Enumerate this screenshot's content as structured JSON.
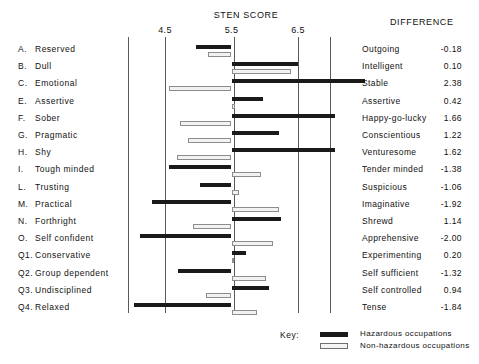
{
  "header": {
    "sten_title": "STEN SCORE",
    "difference_title": "DIFFERENCE"
  },
  "axis": {
    "ticks": [
      {
        "label": "4.5",
        "value": 4.5
      },
      {
        "label": "5.5",
        "value": 5.5
      },
      {
        "label": "6.5",
        "value": 6.5
      }
    ]
  },
  "key": {
    "title": "Key:",
    "hazardous_label": "Hazardous occupations",
    "nonhazardous_label": "Non-hazardous occupations"
  },
  "colors": {
    "hazardous": "#1a1a1a",
    "nonhazardous": "#f2f2f2",
    "nonhazardous_border": "#8d8d8d",
    "gridline": "#5a5a5a",
    "text": "#111111",
    "background": "#ffffff"
  },
  "chart_data": {
    "type": "bar",
    "title": "STEN SCORE",
    "xlabel": "STEN SCORE",
    "ylabel": "",
    "xlim": [
      4.0,
      7.5
    ],
    "grid": true,
    "orientation": "horizontal",
    "baseline": 5.5,
    "legend": [
      "Hazardous occupations",
      "Non-hazardous occupations"
    ],
    "legend_position": "bottom",
    "xticks": [
      4.5,
      5.5,
      6.5
    ],
    "categories": [
      "A. Reserved",
      "B. Dull",
      "C. Emotional",
      "E. Assertive",
      "F. Sober",
      "G. Pragmatic",
      "H. Shy",
      "I. Tough minded",
      "L. Trusting",
      "M. Practical",
      "N. Forthright",
      "O. Self confident",
      "Q1. Conservative",
      "Q2. Group dependent",
      "Q3. Undisciplined",
      "Q4. Relaxed"
    ],
    "right_poles": [
      "Outgoing",
      "Intelligent",
      "Stable",
      "Assertive",
      "Happy-go-lucky",
      "Conscientious",
      "Venturesome",
      "Tender minded",
      "Suspicious",
      "Imaginative",
      "Shrewd",
      "Apprehensive",
      "Experimenting",
      "Self sufficient",
      "Self controlled",
      "Tense"
    ],
    "differences": [
      -0.18,
      0.1,
      2.38,
      0.42,
      1.66,
      1.22,
      1.62,
      -1.38,
      -1.06,
      -1.92,
      1.14,
      -2.0,
      0.2,
      -1.32,
      0.94,
      -1.84
    ],
    "series": [
      {
        "name": "Hazardous occupations",
        "values": [
          4.96,
          6.5,
          7.5,
          5.98,
          7.06,
          6.22,
          7.06,
          4.56,
          5.02,
          4.3,
          6.24,
          4.12,
          5.72,
          4.7,
          6.06,
          4.04
        ]
      },
      {
        "name": "Non-hazardous occupations",
        "values": [
          5.14,
          6.4,
          4.56,
          5.56,
          4.72,
          4.84,
          4.68,
          5.94,
          5.62,
          6.22,
          4.92,
          6.12,
          5.52,
          6.02,
          5.12,
          5.88
        ]
      }
    ]
  },
  "rows": [
    {
      "key": "A.",
      "left": "Reserved",
      "right": "Outgoing",
      "diff": "-0.18",
      "haz": {
        "start": 4.96,
        "end": 5.5
      },
      "non": {
        "start": 5.5,
        "end": 5.14
      }
    },
    {
      "key": "B.",
      "left": "Dull",
      "right": "Intelligent",
      "diff": "0.10",
      "haz": {
        "start": 5.5,
        "end": 6.5
      },
      "non": {
        "start": 5.5,
        "end": 6.4
      }
    },
    {
      "key": "C.",
      "left": "Emotional",
      "right": "Stable",
      "diff": "2.38",
      "haz": {
        "start": 5.5,
        "end": 7.5
      },
      "non": {
        "start": 4.56,
        "end": 5.5
      }
    },
    {
      "key": "E.",
      "left": "Assertive",
      "right": "Assertive",
      "diff": "0.42",
      "haz": {
        "start": 5.5,
        "end": 5.98
      },
      "non": {
        "start": 5.5,
        "end": 5.56
      }
    },
    {
      "key": "F.",
      "left": "Sober",
      "right": "Happy-go-lucky",
      "diff": "1.66",
      "haz": {
        "start": 5.5,
        "end": 7.06
      },
      "non": {
        "start": 4.72,
        "end": 5.5
      }
    },
    {
      "key": "G.",
      "left": "Pragmatic",
      "right": "Conscientious",
      "diff": "1.22",
      "haz": {
        "start": 5.5,
        "end": 6.22
      },
      "non": {
        "start": 4.84,
        "end": 5.5
      }
    },
    {
      "key": "H.",
      "left": "Shy",
      "right": "Venturesome",
      "diff": "1.62",
      "haz": {
        "start": 5.5,
        "end": 7.06
      },
      "non": {
        "start": 4.68,
        "end": 5.5
      }
    },
    {
      "key": "I.",
      "left": "Tough minded",
      "right": "Tender minded",
      "diff": "-1.38",
      "haz": {
        "start": 4.56,
        "end": 5.5
      },
      "non": {
        "start": 5.5,
        "end": 5.94
      }
    },
    {
      "key": "L.",
      "left": "Trusting",
      "right": "Suspicious",
      "diff": "-1.06",
      "haz": {
        "start": 5.02,
        "end": 5.5
      },
      "non": {
        "start": 5.5,
        "end": 5.62
      }
    },
    {
      "key": "M.",
      "left": "Practical",
      "right": "Imaginative",
      "diff": "-1.92",
      "haz": {
        "start": 4.3,
        "end": 5.5
      },
      "non": {
        "start": 5.5,
        "end": 6.22
      }
    },
    {
      "key": "N.",
      "left": "Forthright",
      "right": "Shrewd",
      "diff": "1.14",
      "haz": {
        "start": 5.5,
        "end": 6.24
      },
      "non": {
        "start": 4.92,
        "end": 5.5
      }
    },
    {
      "key": "O.",
      "left": "Self confident",
      "right": "Apprehensive",
      "diff": "-2.00",
      "haz": {
        "start": 4.12,
        "end": 5.5
      },
      "non": {
        "start": 5.5,
        "end": 6.12
      }
    },
    {
      "key": "Q1.",
      "left": "Conservative",
      "right": "Experimenting",
      "diff": "0.20",
      "haz": {
        "start": 5.5,
        "end": 5.72
      },
      "non": {
        "start": 5.5,
        "end": 5.52
      }
    },
    {
      "key": "Q2.",
      "left": "Group dependent",
      "right": "Self sufficient",
      "diff": "-1.32",
      "haz": {
        "start": 4.7,
        "end": 5.5
      },
      "non": {
        "start": 5.5,
        "end": 6.02
      }
    },
    {
      "key": "Q3.",
      "left": "Undisciplined",
      "right": "Self controlled",
      "diff": "0.94",
      "haz": {
        "start": 5.5,
        "end": 6.06
      },
      "non": {
        "start": 5.12,
        "end": 5.5
      }
    },
    {
      "key": "Q4.",
      "left": "Relaxed",
      "right": "Tense",
      "diff": "-1.84",
      "haz": {
        "start": 4.04,
        "end": 5.5
      },
      "non": {
        "start": 5.5,
        "end": 5.88
      }
    }
  ]
}
